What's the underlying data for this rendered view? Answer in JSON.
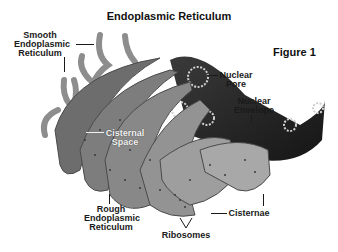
{
  "title": "Endoplasmic Reticulum",
  "figure_label": "Figure 1",
  "labels": {
    "smooth_er": [
      "Smooth",
      "Endoplasmic",
      "Reticulum"
    ],
    "nuclear_pore": [
      "Nuclear",
      "Pore"
    ],
    "nuclear_envelope": [
      "Nuclear",
      "Envelope"
    ],
    "cisternal_space": [
      "Cisternal",
      "Space"
    ],
    "rough_er": [
      "Rough",
      "Endoplasmic",
      "Reticulum"
    ],
    "ribosomes": "Ribosomes",
    "cisternae": "Cisternae"
  },
  "colors": {
    "background": "#ffffff",
    "membrane_light": "#9a9a9a",
    "membrane_dark": "#5a5a5a",
    "nucleus_dark": "#2a2a2a",
    "text": "#1a1a1a"
  }
}
